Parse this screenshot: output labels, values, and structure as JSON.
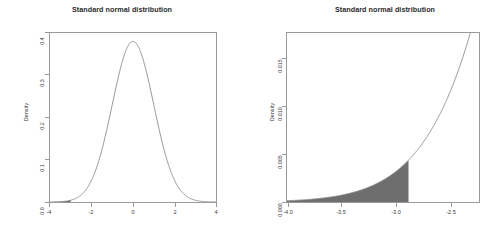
{
  "figure": {
    "background_color": "#ffffff",
    "panel_count": 2
  },
  "left_panel": {
    "title": "Standard normal distribution",
    "ylabel": "Density",
    "xlabel": "",
    "x_ticks": [
      "-4",
      "-2",
      "0",
      "2",
      "4"
    ],
    "y_ticks": [
      "0.0",
      "0.1",
      "0.2",
      "0.3",
      "0.4"
    ]
  },
  "right_panel": {
    "title": "Standard normal distribution",
    "ylabel": "Density",
    "xlabel": "",
    "x_ticks": [
      "-4.0",
      "-3.5",
      "-3.0",
      "-2.5"
    ],
    "y_ticks": [
      "0.000",
      "0.005",
      "0.010",
      "0.015"
    ]
  },
  "chart_data": [
    {
      "type": "line",
      "title": "Standard normal distribution",
      "xlabel": "",
      "ylabel": "Density",
      "xlim": [
        -4,
        4
      ],
      "ylim": [
        0,
        0.42
      ],
      "grid": false,
      "legend": "none",
      "xticks": [
        -4,
        -2,
        0,
        2,
        4
      ],
      "xticklabels": [
        "-4",
        "-2",
        "0",
        "2",
        "4"
      ],
      "yticks": [
        0.0,
        0.1,
        0.2,
        0.3,
        0.4
      ],
      "yticklabels": [
        "0.0",
        "0.1",
        "0.2",
        "0.3",
        "0.4"
      ],
      "series": [
        {
          "name": "standard normal pdf",
          "color": "#8a8a8a",
          "x": [
            -4.0,
            -3.8,
            -3.6,
            -3.4,
            -3.2,
            -3.0,
            -2.8,
            -2.6,
            -2.4,
            -2.2,
            -2.0,
            -1.8,
            -1.6,
            -1.4,
            -1.2,
            -1.0,
            -0.8,
            -0.6,
            -0.4,
            -0.2,
            0.0,
            0.2,
            0.4,
            0.6,
            0.8,
            1.0,
            1.2,
            1.4,
            1.6,
            1.8,
            2.0,
            2.2,
            2.4,
            2.6,
            2.8,
            3.0,
            3.2,
            3.4,
            3.6,
            3.8,
            4.0
          ],
          "y": [
            0.00013,
            0.00029,
            0.00061,
            0.00123,
            0.00238,
            0.00443,
            0.00792,
            0.01358,
            0.02239,
            0.03547,
            0.05399,
            0.07895,
            0.11092,
            0.14973,
            0.19419,
            0.24197,
            0.28969,
            0.33322,
            0.36827,
            0.39104,
            0.39894,
            0.39104,
            0.36827,
            0.33322,
            0.28969,
            0.24197,
            0.19419,
            0.14973,
            0.11092,
            0.07895,
            0.05399,
            0.03547,
            0.02239,
            0.01358,
            0.00792,
            0.00443,
            0.00238,
            0.00123,
            0.00061,
            0.00029,
            0.00013
          ]
        }
      ],
      "shaded_region": {
        "label": "lower tail",
        "x_from": -4.0,
        "x_to": -3.0,
        "fill_color": "#6e6e6e"
      }
    },
    {
      "type": "line",
      "title": "Standard normal distribution",
      "xlabel": "",
      "ylabel": "Density",
      "xlim": [
        -4.0,
        -2.42
      ],
      "ylim": [
        0,
        0.0179
      ],
      "grid": false,
      "legend": "none",
      "xticks": [
        -4.0,
        -3.5,
        -3.0,
        -2.5
      ],
      "xticklabels": [
        "-4.0",
        "-3.5",
        "-3.0",
        "-2.5"
      ],
      "yticks": [
        0.0,
        0.005,
        0.01,
        0.015
      ],
      "yticklabels": [
        "0.000",
        "0.005",
        "0.010",
        "0.015"
      ],
      "series": [
        {
          "name": "standard normal pdf (lower tail zoom)",
          "color": "#8a8a8a",
          "x": [
            -4.0,
            -3.9,
            -3.8,
            -3.7,
            -3.6,
            -3.5,
            -3.4,
            -3.3,
            -3.2,
            -3.1,
            -3.0,
            -2.9,
            -2.8,
            -2.7,
            -2.6,
            -2.5,
            -2.45,
            -2.42
          ],
          "y": [
            0.000134,
            0.000199,
            0.000292,
            0.000425,
            0.000612,
            0.000873,
            0.001232,
            0.001723,
            0.002384,
            0.003267,
            0.004432,
            0.005953,
            0.007915,
            0.010421,
            0.013583,
            0.017528,
            0.019699,
            0.021069
          ]
        }
      ],
      "shaded_region": {
        "label": "lower tail",
        "x_from": -4.0,
        "x_to": -3.0,
        "fill_color": "#6e6e6e"
      }
    }
  ]
}
